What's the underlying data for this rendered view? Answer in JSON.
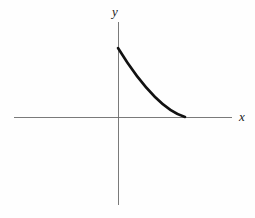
{
  "figure": {
    "title": "",
    "background_color": "#fefefe",
    "width": 255,
    "height": 218
  },
  "axes": {
    "x_axis": {
      "label": "x",
      "color": "#6b6b6b",
      "start_px": 14,
      "end_px": 232,
      "y_px": 117,
      "stroke_width": 0.9
    },
    "y_axis": {
      "label": "y",
      "color": "#6b6b6b",
      "start_px": 22,
      "end_px": 205,
      "x_px": 118,
      "stroke_width": 0.9
    },
    "origin": {
      "x_px": 118,
      "y_px": 117
    }
  },
  "chart_data": {
    "type": "line",
    "title": "",
    "xlabel": "x",
    "ylabel": "y",
    "grid": false,
    "legend": null,
    "xlim": [
      -1.55,
      1.7
    ],
    "ylim": [
      -1.3,
      0.72
    ],
    "series": [
      {
        "name": "decaying curve",
        "color": "#111111",
        "stroke_width": 2.6,
        "x": [
          0.0,
          0.1,
          0.2,
          0.3,
          0.4,
          0.5,
          0.6,
          0.7,
          0.8,
          0.9,
          1.0
        ],
        "y": [
          0.69,
          0.585,
          0.49,
          0.405,
          0.325,
          0.255,
          0.19,
          0.135,
          0.085,
          0.04,
          0.0
        ],
        "x_px": [
          118,
          124.7,
          131.4,
          138.1,
          144.8,
          151.5,
          158.2,
          164.9,
          171.6,
          178.3,
          185
        ],
        "y_px": [
          48,
          55.2,
          61.7,
          67.5,
          73.0,
          77.8,
          82.3,
          86.1,
          89.5,
          92.5,
          95.0
        ],
        "annotations": []
      }
    ]
  },
  "curve_path": "M 118 48 C 129 66, 141 83, 155 97 C 165 107, 175 114, 185 117",
  "colors": {
    "curve": "#111111",
    "axis": "#6b6b6b",
    "label_text": "#1a1a1a",
    "background": "#fefefe"
  }
}
